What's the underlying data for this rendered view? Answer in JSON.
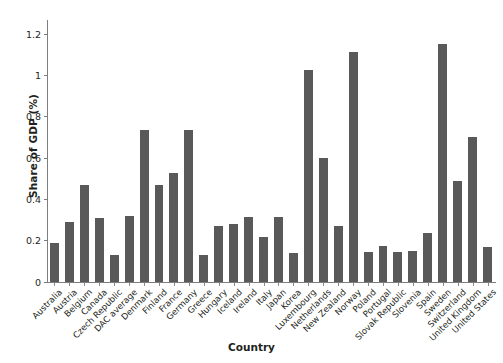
{
  "chart_data": {
    "type": "bar",
    "title": "",
    "xlabel": "Country",
    "ylabel": "Share of GDP (%)",
    "ylim": [
      0,
      1.27
    ],
    "yticks": [
      0,
      0.2,
      0.4,
      0.6,
      0.8,
      1,
      1.2
    ],
    "ytick_labels": [
      "0",
      "0.2",
      "0.4",
      "0.6",
      "0.8",
      "1",
      "1.2"
    ],
    "grid": false,
    "legend": false,
    "bar_color": "#595959",
    "axis_color": "#7d7d7d",
    "categories": [
      "Australia",
      "Austria",
      "Belgium",
      "Canada",
      "Czech Republic",
      "DAC average",
      "Denmark",
      "Finland",
      "France",
      "Germany",
      "Greece",
      "Hungary",
      "Iceland",
      "Ireland",
      "Italy",
      "Japan",
      "Korea",
      "Luxembourg",
      "Netherlands",
      "New Zealand",
      "Norway",
      "Poland",
      "Portugal",
      "Slovak Republic",
      "Slovenia",
      "Spain",
      "Sweden",
      "Switzerland",
      "United Kingdom",
      "United States"
    ],
    "values": [
      0.19,
      0.29,
      0.47,
      0.31,
      0.13,
      0.32,
      0.735,
      0.47,
      0.53,
      0.735,
      0.13,
      0.27,
      0.28,
      0.315,
      0.22,
      0.315,
      0.14,
      1.03,
      0.6,
      0.27,
      1.115,
      0.145,
      0.175,
      0.145,
      0.15,
      0.24,
      1.155,
      0.49,
      0.705,
      0.17
    ]
  }
}
